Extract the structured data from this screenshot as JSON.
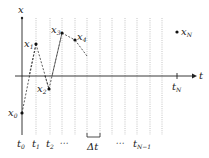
{
  "diagram": {
    "axes": {
      "x_label": "x",
      "t_label": "t"
    },
    "points": [
      {
        "name": "x",
        "sub": "0",
        "cx": 22,
        "cy": 113,
        "lx": 8,
        "ly": 116
      },
      {
        "name": "x",
        "sub": "1",
        "cx": 36,
        "cy": 44,
        "lx": 24,
        "ly": 47
      },
      {
        "name": "x",
        "sub": "2",
        "cx": 49,
        "cy": 89,
        "lx": 37,
        "ly": 92
      },
      {
        "name": "x",
        "sub": "3",
        "cx": 62,
        "cy": 33,
        "lx": 51,
        "ly": 33
      },
      {
        "name": "x",
        "sub": "4",
        "cx": 75,
        "cy": 40,
        "lx": 77,
        "ly": 40
      },
      {
        "name": "x",
        "sub": "N",
        "cx": 177,
        "cy": 32,
        "lx": 181,
        "ly": 35
      }
    ],
    "time_labels": {
      "t0": {
        "name": "t",
        "sub": "0"
      },
      "t1": {
        "name": "t",
        "sub": "1"
      },
      "t2": {
        "name": "t",
        "sub": "2"
      },
      "dots_left": "⋯",
      "delta_t": "Δt",
      "dots_right": "⋯",
      "tNm1": {
        "name": "t",
        "sub": "N−1"
      },
      "tN": {
        "name": "t",
        "sub": "N"
      }
    },
    "grid_lines_x": [
      36,
      50,
      62,
      75,
      87,
      100,
      112,
      125,
      137,
      150,
      162
    ]
  }
}
